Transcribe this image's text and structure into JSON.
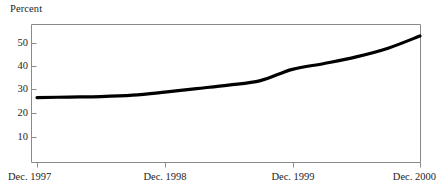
{
  "chart_data": {
    "type": "line",
    "title": "",
    "subtitle": "",
    "ylabel": "Percent",
    "xlabel": "",
    "ylim": [
      0,
      57
    ],
    "yticks": [
      10,
      20,
      30,
      40,
      50
    ],
    "ytick_labels": [
      "10",
      "20",
      "30",
      "40",
      "50"
    ],
    "xticks": [
      "Dec. 1997",
      "Dec. 1998",
      "Dec. 1999",
      "Dec. 2000"
    ],
    "xlim": [
      "Dec. 1997",
      "Dec. 2000"
    ],
    "grid": false,
    "legend": "none",
    "line_color": "#000000",
    "frame_color": "#8a8a8a",
    "background": "#ffffff",
    "series": [
      {
        "name": "Percent",
        "x": [
          "Dec. 1997",
          "Mar. 1998",
          "Jun. 1998",
          "Sep. 1998",
          "Dec. 1998",
          "Mar. 1999",
          "Jun. 1999",
          "Sep. 1999",
          "Dec. 1999",
          "Mar. 2000",
          "Jun. 2000",
          "Sep. 2000",
          "Dec. 2000"
        ],
        "values": [
          27.0,
          27.2,
          27.4,
          28.0,
          29.3,
          30.8,
          32.3,
          34.2,
          39.0,
          41.5,
          44.3,
          48.0,
          53.2
        ]
      }
    ],
    "annotations": []
  },
  "labels": {
    "y_axis_title": "Percent",
    "ytick_10": "10",
    "ytick_20": "20",
    "ytick_30": "30",
    "ytick_40": "40",
    "ytick_50": "50",
    "xtick_1": "Dec. 1997",
    "xtick_2": "Dec. 1998",
    "xtick_3": "Dec. 1999",
    "xtick_4": "Dec. 2000"
  }
}
